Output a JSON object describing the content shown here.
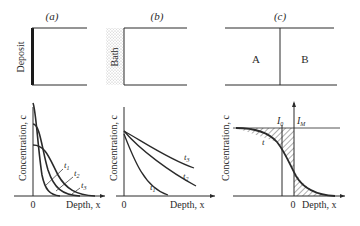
{
  "panels": [
    {
      "id": "a",
      "label": "(a)",
      "source_label": "Deposit",
      "ylabel": "Concentration, c",
      "xlabel": "Depth, x",
      "origin_label": "0",
      "curves": [
        "t1",
        "t2",
        "t3"
      ],
      "curve_labels": [
        {
          "base": "t",
          "sub": "1"
        },
        {
          "base": "t",
          "sub": "2"
        },
        {
          "base": "t",
          "sub": "3"
        }
      ]
    },
    {
      "id": "b",
      "label": "(b)",
      "source_label": "Bath",
      "ylabel": "Concentration, c",
      "xlabel": "Depth, x",
      "origin_label": "0",
      "curve_labels": [
        {
          "base": "t",
          "sub": "1"
        },
        {
          "base": "t",
          "sub": "2"
        },
        {
          "base": "t",
          "sub": "3"
        }
      ]
    },
    {
      "id": "c",
      "label": "(c)",
      "region_left": "A",
      "region_right": "B",
      "ylabel": "Concentration, c",
      "xlabel": "Depth, x",
      "origin_label": "0",
      "curve_label": "t",
      "interface_labels": [
        {
          "base": "I",
          "sub": "0"
        },
        {
          "base": "I",
          "sub": "M"
        }
      ]
    }
  ]
}
